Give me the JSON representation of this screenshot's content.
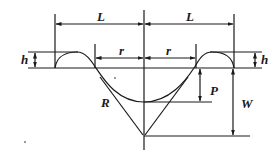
{
  "diagram": {
    "labels": {
      "L_left": "L",
      "L_right": "L",
      "r_left": "r",
      "r_right": "r",
      "h_left": "h",
      "h_right": "h",
      "R": "R",
      "P": "P",
      "W": "W"
    },
    "colors": {
      "line": "#1a1a1a",
      "background": "#ffffff"
    }
  }
}
